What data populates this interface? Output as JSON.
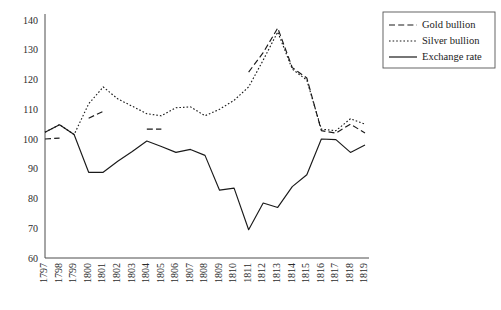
{
  "chart_data": {
    "type": "line",
    "title": "",
    "subtitle": "",
    "xlabel": "",
    "ylabel": "",
    "grid": false,
    "legend_position": "top-right",
    "xlim": [
      1797,
      1819
    ],
    "ylim": [
      60,
      140
    ],
    "ytick_step": 10,
    "categories": [
      "1797",
      "1798",
      "1799",
      "1800",
      "1801",
      "1802",
      "1803",
      "1804",
      "1805",
      "1806",
      "1807",
      "1808",
      "1809",
      "1810",
      "1811",
      "1812",
      "1813",
      "1814",
      "1815",
      "1816",
      "1817",
      "1818",
      "1819"
    ],
    "yticks": [
      "140",
      "130",
      "120",
      "110",
      "100",
      "90",
      "80",
      "70",
      "60"
    ],
    "series": [
      {
        "name": "Gold bullion",
        "style": "dashed",
        "color": "#1a1a1a",
        "values": [
          100.0,
          100.3,
          null,
          107.0,
          109.3,
          null,
          null,
          103.3,
          103.3,
          null,
          null,
          null,
          null,
          null,
          122.5,
          129.0,
          137.3,
          124.0,
          120.5,
          102.8,
          102.0,
          105.0,
          102.0
        ]
      },
      {
        "name": "Silver bullion",
        "style": "dotted",
        "color": "#1a1a1a",
        "values": [
          102.3,
          104.8,
          101.5,
          111.8,
          117.5,
          113.5,
          111.0,
          108.5,
          107.8,
          110.5,
          110.8,
          107.8,
          110.0,
          113.0,
          117.5,
          126.5,
          136.0,
          123.5,
          119.8,
          103.3,
          102.8,
          106.8,
          105.0
        ]
      },
      {
        "name": "Exchange rate",
        "style": "solid",
        "color": "#1a1a1a",
        "values": [
          102.3,
          104.8,
          101.5,
          88.8,
          88.8,
          92.5,
          95.8,
          99.3,
          97.5,
          95.5,
          96.5,
          94.5,
          82.8,
          83.5,
          69.5,
          78.5,
          77.0,
          84.0,
          88.0,
          100.0,
          99.8,
          95.5,
          98.0
        ]
      }
    ]
  },
  "legend": {
    "items": [
      {
        "label": "Gold bullion",
        "style": "dashed"
      },
      {
        "label": "Silver bullion",
        "style": "dotted"
      },
      {
        "label": "Exchange rate",
        "style": "solid"
      }
    ]
  }
}
